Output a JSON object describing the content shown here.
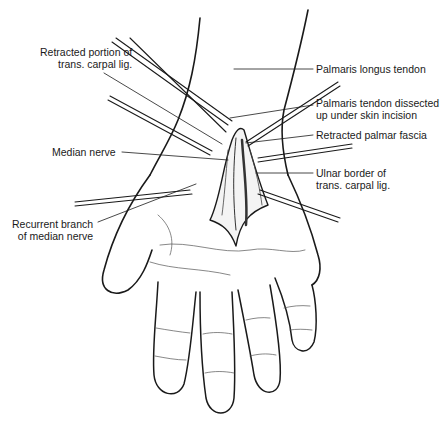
{
  "figure": {
    "colors": {
      "ink": "#1a1a1a",
      "background": "#ffffff",
      "shade": "#7a7a7a"
    }
  },
  "labels": [
    {
      "id": "retracted-portion",
      "lines": [
        "Retracted portion of",
        "trans. carpal lig."
      ],
      "side": "left"
    },
    {
      "id": "median-nerve",
      "lines": [
        "Median nerve"
      ],
      "side": "left"
    },
    {
      "id": "recurrent-branch",
      "lines": [
        "Recurrent branch",
        "of median nerve"
      ],
      "side": "left"
    },
    {
      "id": "palmaris-longus",
      "lines": [
        "Palmaris longus tendon"
      ],
      "side": "right"
    },
    {
      "id": "palmaris-dissected",
      "lines": [
        "Palmaris tendon dissected",
        "up under skin incision"
      ],
      "side": "right"
    },
    {
      "id": "retracted-fascia",
      "lines": [
        "Retracted palmar fascia"
      ],
      "side": "right"
    },
    {
      "id": "ulnar-border",
      "lines": [
        "Ulnar border of",
        "trans. carpal lig."
      ],
      "side": "right"
    }
  ]
}
